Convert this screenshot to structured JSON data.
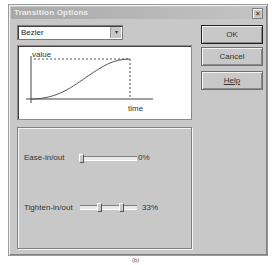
{
  "window": {
    "title": "Transition Options",
    "close_icon": "close-icon"
  },
  "curve_type": {
    "selected": "Bezier"
  },
  "buttons": {
    "ok": "OK",
    "cancel": "Cancel",
    "help": "Help"
  },
  "graph": {
    "y_label": "value",
    "x_label": "time"
  },
  "sliders": [
    {
      "label": "Ease-in/out",
      "value": "0%",
      "thumbs": [
        0
      ]
    },
    {
      "label": "Tighten-in/out",
      "value": "33%",
      "thumbs": [
        0.33,
        0.67
      ]
    }
  ],
  "caption": "(b)"
}
